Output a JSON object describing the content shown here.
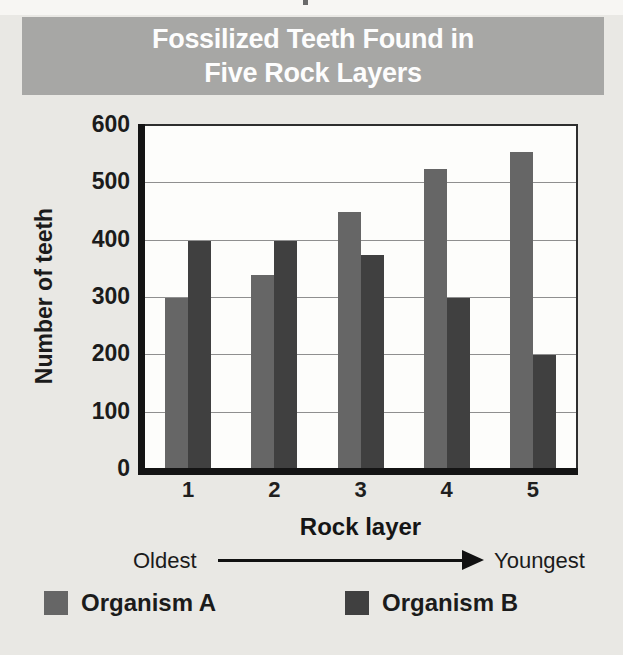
{
  "title": {
    "line1": "Fossilized Teeth Found in",
    "line2": "Five Rock Layers"
  },
  "chart_data": {
    "type": "bar",
    "title": "Fossilized Teeth Found in Five Rock Layers",
    "categories": [
      "1",
      "2",
      "3",
      "4",
      "5"
    ],
    "series": [
      {
        "name": "Organism A",
        "color": "#666666",
        "values": [
          300,
          340,
          450,
          525,
          555
        ]
      },
      {
        "name": "Organism B",
        "color": "#404040",
        "values": [
          400,
          400,
          375,
          300,
          200
        ]
      }
    ],
    "xlabel": "Rock layer",
    "ylabel": "Number of teeth",
    "ylim": [
      0,
      600
    ],
    "yticks": [
      0,
      100,
      200,
      300,
      400,
      500,
      600
    ],
    "grid": true,
    "legend_position": "bottom",
    "x_axis_note": {
      "left": "Oldest",
      "right": "Youngest"
    }
  },
  "colors": {
    "background": "#e9e8e4",
    "title_bar": "#a7a7a5",
    "title_text": "#fdfdfd",
    "plot_bg": "#fdfdfb",
    "gridline": "#8f8f8f",
    "axis": "#141414",
    "organism_a": "#666666",
    "organism_b": "#404040"
  }
}
